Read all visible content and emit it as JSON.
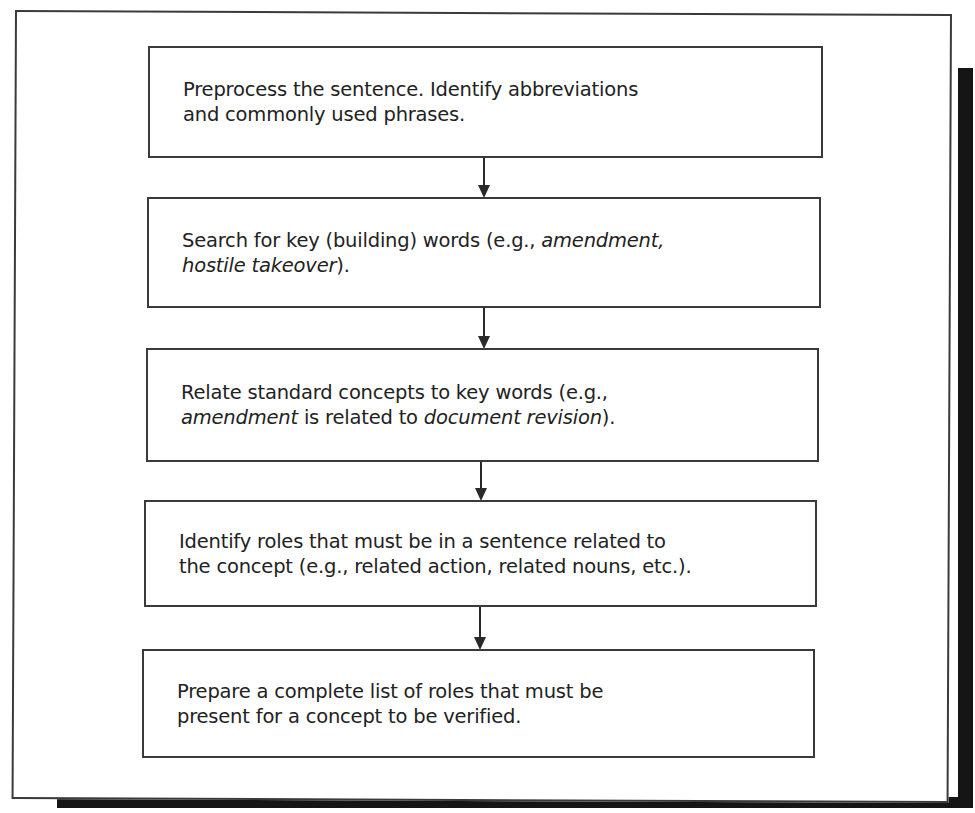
{
  "diagram": {
    "type": "flowchart",
    "direction": "top-to-bottom",
    "steps": [
      {
        "id": 1,
        "parts": [
          {
            "text": "Preprocess the sentence. Identify abbreviations",
            "italic": false
          },
          {
            "text": "and commonly used phrases.",
            "italic": false
          }
        ],
        "line1": "Preprocess the sentence. Identify abbreviations",
        "line2": "and commonly used phrases."
      },
      {
        "id": 2,
        "line1_a": "Search for key (building) words (e.g., ",
        "line1_b": "amendment,",
        "line2_a": "hostile takeover",
        "line2_b": ")."
      },
      {
        "id": 3,
        "line1": "Relate standard concepts to key words (e.g.,",
        "line2_a": "amendment",
        "line2_b": " is related to ",
        "line2_c": "document revision",
        "line2_d": ")."
      },
      {
        "id": 4,
        "line1": "Identify roles that must be in a sentence related to",
        "line2": "the concept (e.g., related action, related nouns, etc.)."
      },
      {
        "id": 5,
        "line1": "Prepare a complete list of roles that must be",
        "line2": "present for a concept to be verified."
      }
    ],
    "edges": [
      {
        "from": 1,
        "to": 2
      },
      {
        "from": 2,
        "to": 3
      },
      {
        "from": 3,
        "to": 4
      },
      {
        "from": 4,
        "to": 5
      }
    ]
  },
  "colors": {
    "line": "#3a3a3a",
    "shadow": "#151515",
    "background": "#ffffff",
    "text": "#222222"
  }
}
